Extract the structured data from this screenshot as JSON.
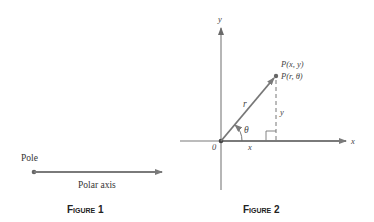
{
  "figures": [
    {
      "id": "figure-1",
      "caption": "Figure 1",
      "labels": {
        "pole": "Pole",
        "polar_axis": "Polar axis"
      }
    },
    {
      "id": "figure-2",
      "caption": "Figure 2",
      "labels": {
        "y_axis": "y",
        "x_axis": "x",
        "origin": "0",
        "point_cartesian": "P(x, y)",
        "point_polar": "P(r, θ)",
        "radius": "r",
        "angle": "θ",
        "x_leg": "x",
        "y_leg": "y"
      }
    }
  ],
  "colors": {
    "line": "#7a7a7a",
    "text": "#333333",
    "dot": "#555555"
  }
}
